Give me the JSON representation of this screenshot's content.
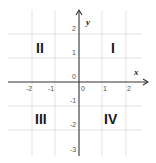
{
  "diagram": {
    "type": "cartesian-coordinate-plane",
    "x_axis": {
      "label": "x",
      "ticks": [
        {
          "value": -2,
          "label": "-2"
        },
        {
          "value": -1,
          "label": "-1"
        },
        {
          "value": 0,
          "label": "0"
        },
        {
          "value": 1,
          "label": "1"
        },
        {
          "value": 2,
          "label": "2"
        }
      ]
    },
    "y_axis": {
      "label": "y",
      "ticks": [
        {
          "value": 2,
          "label": "2"
        },
        {
          "value": 1,
          "label": "1"
        },
        {
          "value": 0,
          "label": "0"
        },
        {
          "value": -1,
          "label": "-1"
        },
        {
          "value": -2,
          "label": "-2"
        },
        {
          "value": -3,
          "label": "-3"
        }
      ]
    },
    "quadrants": [
      {
        "id": "I",
        "label": "I"
      },
      {
        "id": "II",
        "label": "II"
      },
      {
        "id": "III",
        "label": "III"
      },
      {
        "id": "IV",
        "label": "IV"
      }
    ],
    "colors": {
      "grid": "#d9d9d9",
      "axis": "#333333",
      "text": "#1a1a1a"
    }
  }
}
